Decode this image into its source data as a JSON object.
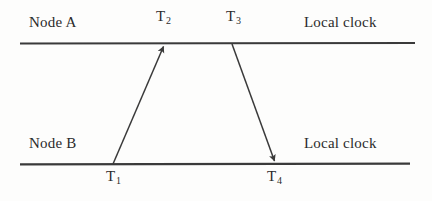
{
  "figure": {
    "type": "timing-diagram",
    "background_color": "#fdfdfc",
    "line_color": "#3a3a3a",
    "text_color": "#2b2b2b"
  },
  "timelines": [
    {
      "id": "node-a",
      "node_label": "Node A",
      "clock_label": "Local clock",
      "y": 43,
      "x_start": 20,
      "x_end": 415
    },
    {
      "id": "node-b",
      "node_label": "Node B",
      "clock_label": "Local clock",
      "y": 164,
      "x_start": 20,
      "x_end": 410
    }
  ],
  "timestamps": [
    {
      "id": "t1",
      "base": "T",
      "sub": "1",
      "x": 113,
      "y": 164,
      "placement": "below-bottom-line"
    },
    {
      "id": "t2",
      "base": "T",
      "sub": "2",
      "x": 163,
      "y": 43,
      "placement": "above-top-line"
    },
    {
      "id": "t3",
      "base": "T",
      "sub": "3",
      "x": 232,
      "y": 43,
      "placement": "above-top-line"
    },
    {
      "id": "t4",
      "base": "T",
      "sub": "4",
      "x": 275,
      "y": 164,
      "placement": "below-bottom-line"
    }
  ],
  "messages": [
    {
      "id": "request-arrow",
      "direction": "up",
      "from": {
        "node": "node-b",
        "timestamp": "T1",
        "x": 113,
        "y": 164
      },
      "to": {
        "node": "node-a",
        "timestamp": "T2",
        "x": 163,
        "y": 45
      }
    },
    {
      "id": "reply-arrow",
      "direction": "down",
      "from": {
        "node": "node-a",
        "timestamp": "T3",
        "x": 232,
        "y": 44
      },
      "to": {
        "node": "node-b",
        "timestamp": "T4",
        "x": 275,
        "y": 163
      }
    }
  ]
}
